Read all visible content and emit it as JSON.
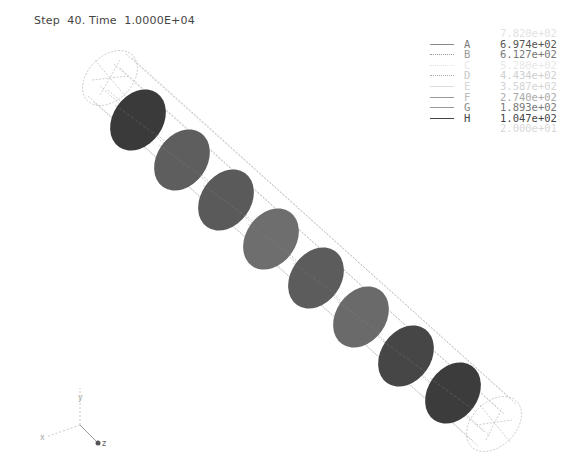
{
  "header": {
    "step_label": "Step",
    "step_value": "40.",
    "time_label": "Time",
    "time_value": "1.0000E+04"
  },
  "legend": {
    "top_value": "7.820e+02",
    "entries": [
      {
        "key": "A",
        "value": "6.974e+02",
        "style": "solid",
        "color": "#888888",
        "text_color": "#555555"
      },
      {
        "key": "B",
        "value": "6.127e+02",
        "style": "dotted",
        "color": "#aaaaaa",
        "text_color": "#777777"
      },
      {
        "key": "C",
        "value": "5.280e+02",
        "style": "dotted",
        "color": "#e0e0e0",
        "text_color": "#e4e4e4"
      },
      {
        "key": "D",
        "value": "4.434e+02",
        "style": "dotted",
        "color": "#bbbbbb",
        "text_color": "#cccccc"
      },
      {
        "key": "E",
        "value": "3.587e+02",
        "style": "solid",
        "color": "#dddddd",
        "text_color": "#d4d4d4"
      },
      {
        "key": "F",
        "value": "2.740e+02",
        "style": "solid",
        "color": "#999999",
        "text_color": "#aaaaaa"
      },
      {
        "key": "G",
        "value": "1.893e+02",
        "style": "solid",
        "color": "#999999",
        "text_color": "#777777"
      },
      {
        "key": "H",
        "value": "1.047e+02",
        "style": "solid",
        "color": "#444444",
        "text_color": "#444444"
      }
    ],
    "bottom_value": "2.000e+01"
  },
  "model": {
    "cross_sections": [
      {
        "cx": 138,
        "cy": 120,
        "color": "#3a3a3a"
      },
      {
        "cx": 182,
        "cy": 160,
        "color": "#5e5e5e"
      },
      {
        "cx": 226,
        "cy": 200,
        "color": "#5a5a5a"
      },
      {
        "cx": 271,
        "cy": 239,
        "color": "#6e6e6e"
      },
      {
        "cx": 316,
        "cy": 278,
        "color": "#5c5c5c"
      },
      {
        "cx": 361,
        "cy": 317,
        "color": "#6a6a6a"
      },
      {
        "cx": 406,
        "cy": 356,
        "color": "#464646"
      },
      {
        "cx": 453,
        "cy": 393,
        "color": "#3c3c3c"
      }
    ]
  },
  "axes_triad": {
    "x_label": "x",
    "y_label": "y",
    "z_label": "z"
  }
}
